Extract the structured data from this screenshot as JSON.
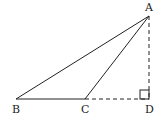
{
  "diagram": {
    "type": "geometry-triangle",
    "points": {
      "A": {
        "label": "A",
        "x": 149,
        "y": 16
      },
      "B": {
        "label": "B",
        "x": 16,
        "y": 99
      },
      "C": {
        "label": "C",
        "x": 85,
        "y": 99
      },
      "D": {
        "label": "D",
        "x": 149,
        "y": 99
      }
    },
    "solid_segments": [
      "AB",
      "AC",
      "BC"
    ],
    "dashed_segments": [
      "AD",
      "CD"
    ],
    "right_angle_at": "D",
    "colors": {
      "line": "#222222",
      "background": "#ffffff"
    }
  }
}
